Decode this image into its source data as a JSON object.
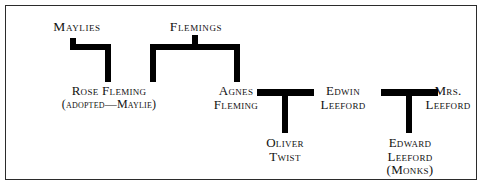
{
  "diagram": {
    "title_text": "",
    "border_color": "#2b2b2b",
    "connector_color": "#000000",
    "background_color": "#ffffff",
    "type": "family-tree",
    "groups": [
      {
        "id": "maylies",
        "label": "Maylies"
      },
      {
        "id": "flemings",
        "label": "Flemings"
      }
    ],
    "people": [
      {
        "id": "rose-fleming",
        "lines": [
          "Rose Fleming",
          "(adopted—Maylie)"
        ]
      },
      {
        "id": "agnes-fleming",
        "lines": [
          "Agnes",
          "Fleming"
        ]
      },
      {
        "id": "edwin-leeford",
        "lines": [
          "Edwin",
          "Leeford"
        ]
      },
      {
        "id": "mrs-leeford",
        "lines": [
          "Mrs.",
          "Leeford"
        ]
      },
      {
        "id": "oliver-twist",
        "lines": [
          "Oliver",
          "Twist"
        ]
      },
      {
        "id": "edward-leeford-monks",
        "lines": [
          "Edward",
          "Leeford",
          "(Monks)"
        ]
      }
    ]
  }
}
